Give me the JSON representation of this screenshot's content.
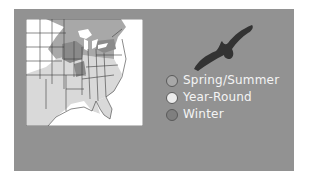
{
  "panel": {
    "background": "#929292"
  },
  "map": {
    "subject": "eastern-united-states-range-map",
    "colors": {
      "spring_summer": "#a8a8a8",
      "year_round": "#d9d9d9",
      "winter": "#7f7f7f",
      "non_range": "#ffffff",
      "border": "#3c3c3c"
    }
  },
  "bird": {
    "icon": "bird-silhouette-icon",
    "color": "#333333"
  },
  "legend": {
    "items": [
      {
        "label": "Spring/Summer",
        "color": "#a8a8a8"
      },
      {
        "label": "Year-Round",
        "color": "#ececec"
      },
      {
        "label": "Winter",
        "color": "#7f7f7f"
      }
    ]
  }
}
